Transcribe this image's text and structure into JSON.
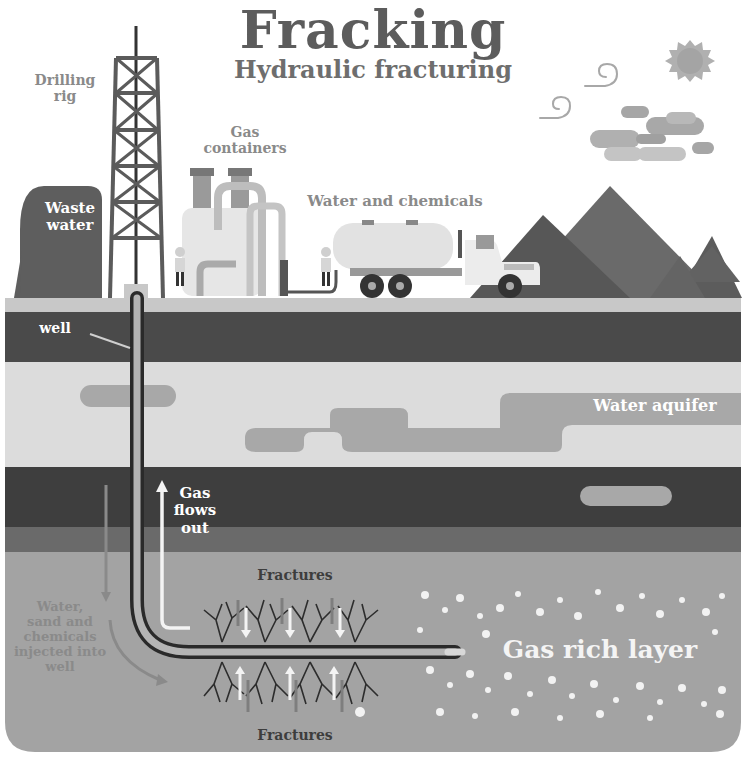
{
  "header": {
    "title": "Fracking",
    "subtitle": "Hydraulic fracturing"
  },
  "labels": {
    "drilling_rig": "Drilling\nrig",
    "gas_containers": "Gas\ncontainers",
    "water_and_chemicals": "Water and chemicals",
    "waste_water": "Waste\nwater",
    "well": "well",
    "water_aquifer": "Water aquifer",
    "gas_flows_out": "Gas\nflows\nout",
    "fractures_top": "Fractures",
    "fractures_bottom": "Fractures",
    "injection": "Water,\nsand and\nchemicals\ninjected into\nwell",
    "gas_rich_layer": "Gas rich layer"
  },
  "icons": {
    "sun": "sun-icon",
    "wind": "wind-swirl-icon",
    "clouds": "cloud-icon",
    "worker": "worker-icon",
    "truck": "tanker-truck-icon",
    "rig": "drilling-rig-icon"
  },
  "colors": {
    "sky": "#ffffff",
    "ground_surface": "#c8c8c8",
    "dark_soil": "#4a4a4a",
    "aquifer_rock": "#dcdcdc",
    "aquifer_water": "#a8a8a8",
    "deep_dark": "#3e3e3e",
    "mid_band": "#6a6a6a",
    "gas_layer": "#a3a3a3",
    "mountain_dark": "#5a5a5a",
    "mountain_mid": "#6e6e6e",
    "title_text": "#5c5c5c"
  }
}
